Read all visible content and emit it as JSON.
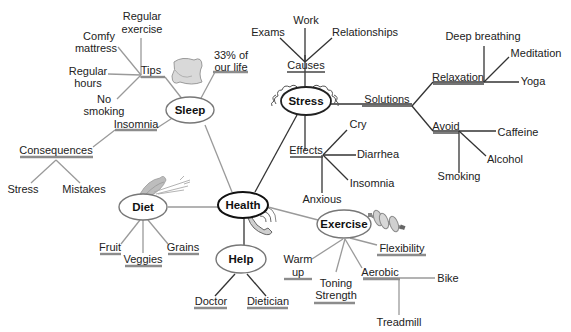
{
  "center": {
    "label": "Health"
  },
  "branches": {
    "sleep": {
      "label": "Sleep",
      "tips": {
        "label": "Tips",
        "items": [
          "Regular exercise",
          "Comfy mattress",
          "Regular hours",
          "No smoking"
        ]
      },
      "fact": "33% of our life",
      "insomnia": "Insomnia",
      "consequences": {
        "label": "Consequences",
        "items": [
          "Stress",
          "Mistakes"
        ]
      },
      "icon": "pillow-icon"
    },
    "stress": {
      "label": "Stress",
      "causes": {
        "label": "Causes",
        "items": [
          "Exams",
          "Work",
          "Relationships"
        ]
      },
      "effects": {
        "label": "Effects",
        "items": [
          "Cry",
          "Diarrhea",
          "Insomnia",
          "Anxious"
        ]
      },
      "solutions": {
        "label": "Solutions",
        "relaxation": {
          "label": "Relaxation",
          "items": [
            "Deep breathing",
            "Meditation",
            "Yoga"
          ]
        },
        "avoid": {
          "label": "Avoid",
          "items": [
            "Caffeine",
            "Alcohol",
            "Smoking"
          ]
        }
      },
      "icon": "squiggle-halo-icon"
    },
    "diet": {
      "label": "Diet",
      "items": [
        "Fruit",
        "Veggies",
        "Grains"
      ],
      "icon": "vegetables-icon"
    },
    "help": {
      "label": "Help",
      "items": [
        "Doctor",
        "Dietician"
      ],
      "icon": "telephone-icon"
    },
    "exercise": {
      "label": "Exercise",
      "items": [
        "Warm up",
        "Toning Strength",
        "Flexibility"
      ],
      "aerobic": {
        "label": "Aerobic",
        "items": [
          "Bike",
          "Treadmill"
        ]
      },
      "icon": "dumbbell-icon"
    }
  }
}
